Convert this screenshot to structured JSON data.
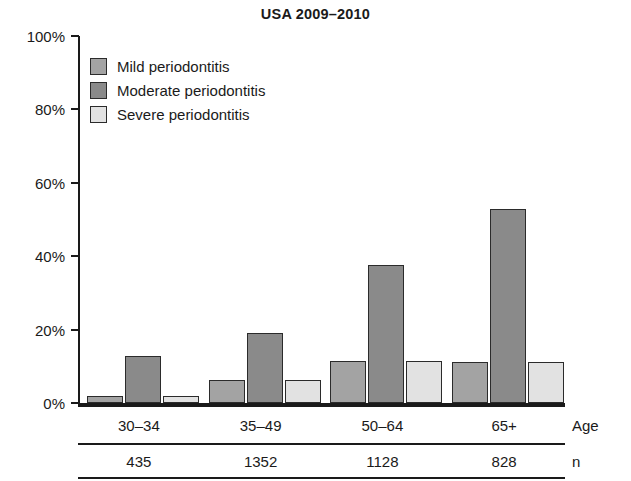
{
  "chart_data": {
    "type": "bar",
    "title": "USA 2009–2010",
    "xlabel": "Age",
    "ylabel": "",
    "ylim": [
      0,
      100
    ],
    "grid": false,
    "legend_position": "inside-top-left",
    "categories": [
      "30–34",
      "35–49",
      "50–64",
      "65+"
    ],
    "y_ticks": [
      "0%",
      "20%",
      "40%",
      "60%",
      "80%",
      "100%"
    ],
    "y_tick_values": [
      0,
      20,
      40,
      60,
      80,
      100
    ],
    "series": [
      {
        "name": "Mild periodontitis",
        "color": "#a3a3a3",
        "values": [
          1.8,
          6.4,
          11.5,
          11.2
        ]
      },
      {
        "name": "Moderate periodontitis",
        "color": "#8a8a8a",
        "values": [
          12.8,
          19.2,
          37.5,
          53.0
        ]
      },
      {
        "name": "Severe periodontitis",
        "color": "#e2e2e2",
        "values": [
          1.8,
          6.4,
          11.5,
          11.2
        ]
      }
    ],
    "sample_sizes": [
      "435",
      "1352",
      "1128",
      "828"
    ],
    "row_labels": {
      "age": "Age",
      "n": "n"
    }
  },
  "legend": {
    "items": [
      {
        "label": "Mild periodontitis",
        "color": "#a3a3a3"
      },
      {
        "label": "Moderate periodontitis",
        "color": "#8a8a8a"
      },
      {
        "label": "Severe periodontitis",
        "color": "#e2e2e2"
      }
    ]
  },
  "colors": {
    "axis": "#1a1a1a",
    "bar_border": "#2b2b2b",
    "background": "#ffffff",
    "mild": "#a3a3a3",
    "moderate": "#8a8a8a",
    "severe": "#e2e2e2"
  }
}
